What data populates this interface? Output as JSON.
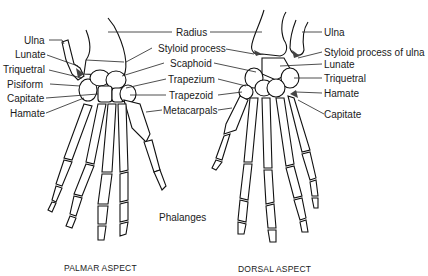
{
  "figure": {
    "colors": {
      "ink": "#1a1a1a",
      "background": "#ffffff"
    }
  },
  "palmar": {
    "caption": "PALMAR ASPECT",
    "left_labels": [
      "Ulna",
      "Lunate",
      "Triquetral",
      "Pisiform",
      "Capitate",
      "Hamate"
    ]
  },
  "center_labels": [
    "Radius",
    "Styloid process",
    "Scaphoid",
    "Trapezium",
    "Trapezoid",
    "Metacarpals",
    "Phalanges"
  ],
  "dorsal": {
    "caption": "DORSAL ASPECT",
    "right_labels": [
      "Ulna",
      "Styloid process of ulna",
      "Lunate",
      "Triquetral",
      "Hamate",
      "Capitate"
    ]
  }
}
